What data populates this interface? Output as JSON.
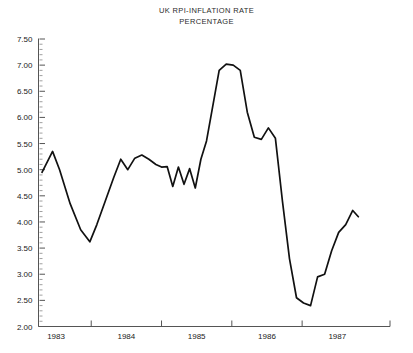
{
  "chart_data": {
    "type": "line",
    "title": "UK RPI-INFLATION RATE",
    "subtitle": "PERCENTAGE",
    "xlabel": "",
    "ylabel": "",
    "grid": false,
    "legend": null,
    "ylim": [
      2.0,
      7.5
    ],
    "ytick_step": 0.5,
    "ytick_labels": [
      "7.50",
      "7.00",
      "6.50",
      "6.00",
      "5.50",
      "5.00",
      "4.50",
      "4.00",
      "3.50",
      "3.00",
      "2.50",
      "2.00"
    ],
    "ytick_values": [
      7.5,
      7.0,
      6.5,
      6.0,
      5.5,
      5.0,
      4.5,
      4.0,
      3.5,
      3.0,
      2.5,
      2.0
    ],
    "yminor_step": 0.1,
    "xlim": [
      1982.75,
      1987.75
    ],
    "xtick_labels": [
      "1983",
      "1984",
      "1985",
      "1986",
      "1987"
    ],
    "xtick_values": [
      1983.0,
      1984.0,
      1985.0,
      1986.0,
      1987.0
    ],
    "x_axis_tick_marks": [
      1982.75,
      1983.5,
      1984.5,
      1985.5,
      1986.5,
      1987.75
    ],
    "series": [
      {
        "name": "UK RPI inflation rate",
        "color": "#111111",
        "x": [
          1982.8,
          1982.95,
          1983.05,
          1983.2,
          1983.35,
          1983.48,
          1983.58,
          1983.7,
          1983.82,
          1983.92,
          1984.02,
          1984.12,
          1984.22,
          1984.32,
          1984.42,
          1984.5,
          1984.58,
          1984.66,
          1984.74,
          1984.82,
          1984.9,
          1984.98,
          1985.06,
          1985.14,
          1985.22,
          1985.32,
          1985.42,
          1985.52,
          1985.62,
          1985.72,
          1985.82,
          1985.92,
          1986.02,
          1986.12,
          1986.22,
          1986.32,
          1986.42,
          1986.52,
          1986.62,
          1986.72,
          1986.82,
          1986.92,
          1987.02,
          1987.12,
          1987.22,
          1987.3
        ],
        "y": [
          4.95,
          5.35,
          5.0,
          4.35,
          3.85,
          3.62,
          3.95,
          4.4,
          4.85,
          5.2,
          5.0,
          5.22,
          5.28,
          5.2,
          5.1,
          5.05,
          5.06,
          4.68,
          5.05,
          4.72,
          5.02,
          4.65,
          5.2,
          5.55,
          6.15,
          6.9,
          7.02,
          7.0,
          6.9,
          6.1,
          5.62,
          5.58,
          5.8,
          5.6,
          4.4,
          3.3,
          2.55,
          2.45,
          2.4,
          2.95,
          3.0,
          3.45,
          3.8,
          3.95,
          4.22,
          4.1
        ]
      }
    ]
  }
}
